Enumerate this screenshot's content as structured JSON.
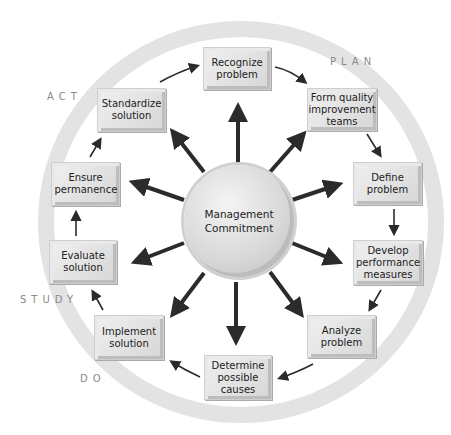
{
  "diagram": {
    "center": {
      "label": "Management Commitment"
    },
    "phases": [
      {
        "id": "plan",
        "label": "PLAN"
      },
      {
        "id": "act",
        "label": "ACT"
      },
      {
        "id": "study",
        "label": "STUDY"
      },
      {
        "id": "do",
        "label": "DO"
      }
    ],
    "steps": [
      {
        "id": "recognize",
        "label": "Recognize problem"
      },
      {
        "id": "form-teams",
        "label": "Form quality improvement teams"
      },
      {
        "id": "define",
        "label": "Define problem"
      },
      {
        "id": "develop-measures",
        "label": "Develop performance measures"
      },
      {
        "id": "analyze",
        "label": "Analyze problem"
      },
      {
        "id": "determine-causes",
        "label": "Determine possible causes"
      },
      {
        "id": "implement",
        "label": "Implement solution"
      },
      {
        "id": "evaluate",
        "label": "Evaluate solution"
      },
      {
        "id": "ensure",
        "label": "Ensure permanence"
      },
      {
        "id": "standardize",
        "label": "Standardize solution"
      }
    ],
    "colors": {
      "ring": "#e3e3e3",
      "box": "#d6d6d6",
      "arrow": "#2b2b2b",
      "phase_text": "#8a8a8a"
    }
  }
}
